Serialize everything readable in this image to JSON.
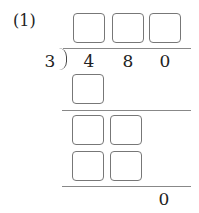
{
  "problem": {
    "number_label": "(1)",
    "divisor": "3",
    "dividend_digits": [
      "4",
      "8",
      "0"
    ],
    "quotient_boxes": [
      "",
      "",
      ""
    ],
    "step1_product_boxes": [
      ""
    ],
    "step2_boxes_row1": [
      "",
      ""
    ],
    "step2_boxes_row2": [
      "",
      ""
    ],
    "remainder": "0"
  }
}
